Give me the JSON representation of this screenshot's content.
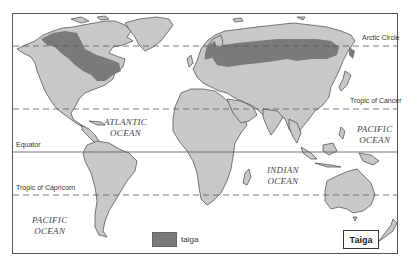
{
  "map": {
    "title": "Taiga",
    "colors": {
      "land": "#c8c8c8",
      "taiga": "#7a7a7a",
      "water": "#ffffff",
      "coastline": "#444444",
      "latitude_lines": "#555555"
    },
    "latitude_lines": [
      {
        "name": "Arctic Circle",
        "style": "dashed"
      },
      {
        "name": "Tropic of Cancer",
        "style": "dashed"
      },
      {
        "name": "Equator",
        "style": "solid"
      },
      {
        "name": "Tropic of Capricorn",
        "style": "dashed"
      }
    ],
    "oceans": [
      {
        "line1": "ATLANTIC",
        "line2": "OCEAN"
      },
      {
        "line1": "PACIFIC",
        "line2": "OCEAN"
      },
      {
        "line1": "INDIAN",
        "line2": "OCEAN"
      },
      {
        "line1": "PACIFIC",
        "line2": "OCEAN"
      }
    ],
    "legend": {
      "items": [
        {
          "label": "taiga",
          "color": "#7a7a7a"
        }
      ]
    }
  }
}
